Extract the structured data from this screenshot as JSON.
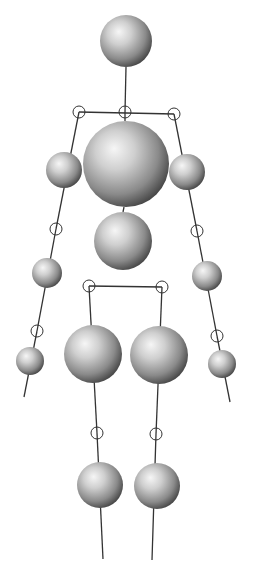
{
  "figure": {
    "title": "",
    "width": 257,
    "height": 573,
    "colors": {
      "background": "#ffffff",
      "line": "#333333",
      "sphere_highlight": "#f4f4f4",
      "sphere_mid": "#b4b4b4",
      "sphere_shadow": "#4a4a4a"
    }
  },
  "spheres": [
    {
      "name": "head",
      "cx": 126,
      "cy": 41,
      "r": 26
    },
    {
      "name": "chest",
      "cx": 126,
      "cy": 164,
      "r": 43
    },
    {
      "name": "left-upper-arm",
      "cx": 64,
      "cy": 170,
      "r": 18
    },
    {
      "name": "right-upper-arm",
      "cx": 187,
      "cy": 172,
      "r": 18
    },
    {
      "name": "abdomen",
      "cx": 123,
      "cy": 241,
      "r": 29
    },
    {
      "name": "left-forearm",
      "cx": 47,
      "cy": 273,
      "r": 15
    },
    {
      "name": "right-forearm",
      "cx": 207,
      "cy": 276,
      "r": 15
    },
    {
      "name": "left-thigh",
      "cx": 93,
      "cy": 354,
      "r": 29
    },
    {
      "name": "right-thigh",
      "cx": 159,
      "cy": 355,
      "r": 29
    },
    {
      "name": "left-hand",
      "cx": 30,
      "cy": 361,
      "r": 14
    },
    {
      "name": "right-hand",
      "cx": 222,
      "cy": 364,
      "r": 14
    },
    {
      "name": "left-shin",
      "cx": 100,
      "cy": 485,
      "r": 23
    },
    {
      "name": "right-shin",
      "cx": 157,
      "cy": 486,
      "r": 23
    }
  ],
  "joints": [
    {
      "name": "neck",
      "cx": 125,
      "cy": 112,
      "r": 6
    },
    {
      "name": "left-shoulder",
      "cx": 79,
      "cy": 112,
      "r": 6
    },
    {
      "name": "right-shoulder",
      "cx": 174,
      "cy": 114,
      "r": 6
    },
    {
      "name": "left-elbow",
      "cx": 56,
      "cy": 229,
      "r": 6
    },
    {
      "name": "right-elbow",
      "cx": 197,
      "cy": 231,
      "r": 6
    },
    {
      "name": "left-wrist",
      "cx": 37,
      "cy": 331,
      "r": 6
    },
    {
      "name": "right-wrist",
      "cx": 217,
      "cy": 336,
      "r": 6
    },
    {
      "name": "left-hip",
      "cx": 89,
      "cy": 286,
      "r": 6
    },
    {
      "name": "right-hip",
      "cx": 162,
      "cy": 287,
      "r": 6
    },
    {
      "name": "left-knee",
      "cx": 97,
      "cy": 433,
      "r": 6
    },
    {
      "name": "right-knee",
      "cx": 156,
      "cy": 434,
      "r": 6
    }
  ],
  "bones": [
    {
      "name": "neck-bone",
      "x1": 126,
      "y1": 67,
      "x2": 125,
      "y2": 112
    },
    {
      "name": "shoulder-bar",
      "x1": 79,
      "y1": 112,
      "x2": 174,
      "y2": 114
    },
    {
      "name": "spine-upper",
      "x1": 125,
      "y1": 112,
      "x2": 125,
      "y2": 121
    },
    {
      "name": "spine-lower",
      "x1": 124,
      "y1": 207,
      "x2": 123,
      "y2": 212
    },
    {
      "name": "left-upper-arm-bone",
      "x1": 79,
      "y1": 112,
      "x2": 56,
      "y2": 229
    },
    {
      "name": "right-upper-arm-bone",
      "x1": 174,
      "y1": 114,
      "x2": 197,
      "y2": 231
    },
    {
      "name": "left-forearm-bone",
      "x1": 56,
      "y1": 229,
      "x2": 37,
      "y2": 331
    },
    {
      "name": "right-forearm-bone",
      "x1": 197,
      "y1": 231,
      "x2": 217,
      "y2": 336
    },
    {
      "name": "left-hand-bone",
      "x1": 37,
      "y1": 331,
      "x2": 24,
      "y2": 397
    },
    {
      "name": "right-hand-bone",
      "x1": 217,
      "y1": 336,
      "x2": 230,
      "y2": 402
    },
    {
      "name": "hip-bar",
      "x1": 89,
      "y1": 286,
      "x2": 162,
      "y2": 287
    },
    {
      "name": "left-thigh-bone",
      "x1": 89,
      "y1": 286,
      "x2": 97,
      "y2": 433
    },
    {
      "name": "right-thigh-bone",
      "x1": 162,
      "y1": 287,
      "x2": 156,
      "y2": 434
    },
    {
      "name": "left-shin-bone",
      "x1": 97,
      "y1": 433,
      "x2": 103,
      "y2": 559
    },
    {
      "name": "right-shin-bone",
      "x1": 156,
      "y1": 434,
      "x2": 152,
      "y2": 560
    }
  ]
}
